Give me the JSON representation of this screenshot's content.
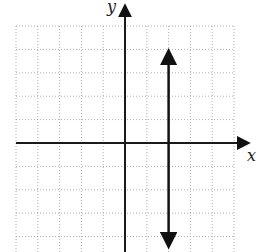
{
  "chart_data": {
    "type": "line",
    "title": "",
    "xlabel": "x",
    "ylabel": "y",
    "xlim": [
      -5,
      5
    ],
    "ylim": [
      -5,
      5
    ],
    "grid": true,
    "series": [
      {
        "name": "vertical line x = 2",
        "equation": "x = 2",
        "x": [
          2,
          2
        ],
        "y": [
          -5,
          4
        ],
        "arrows": "both"
      }
    ]
  },
  "axes": {
    "x_label": "x",
    "y_label": "y"
  },
  "colors": {
    "grid": "#9a9a9a",
    "axis": "#1a1a1a",
    "line": "#111111"
  }
}
